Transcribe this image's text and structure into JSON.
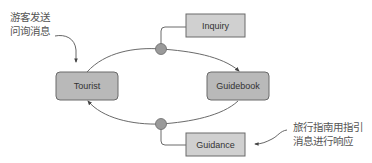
{
  "diagram": {
    "nodes": {
      "tourist": {
        "label": "Tourist",
        "shape": "rounded-rect"
      },
      "guidebook": {
        "label": "Guidebook",
        "shape": "rounded-rect"
      },
      "inquiry": {
        "label": "Inquiry",
        "shape": "rect"
      },
      "guidance": {
        "label": "Guidance",
        "shape": "rect"
      }
    },
    "annotations": {
      "left": {
        "line1": "游客发送",
        "line2": "问询消息"
      },
      "right": {
        "line1": "旅行指南用指引",
        "line2": "消息进行响应"
      }
    },
    "edges": [
      {
        "from": "tourist",
        "to": "guidebook",
        "message": "inquiry"
      },
      {
        "from": "guidebook",
        "to": "tourist",
        "message": "guidance"
      }
    ],
    "colors": {
      "actor_fill": "#b9b9b9",
      "message_fill": "#d0d0d0",
      "stroke": "#6a6a6a",
      "junction_fill": "#9a9a9a",
      "text": "#333333",
      "note_text": "#555555"
    }
  }
}
